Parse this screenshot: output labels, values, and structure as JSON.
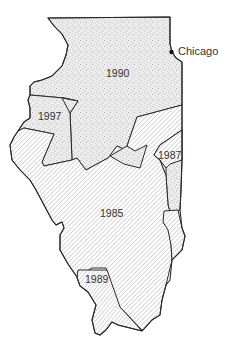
{
  "map": {
    "subject": "Illinois",
    "regions": [
      {
        "label": "1990",
        "fill": "stipple"
      },
      {
        "label": "1997",
        "fill": "stipple"
      },
      {
        "label": "1987",
        "fill": "hatch"
      },
      {
        "label": "1985",
        "fill": "hatch"
      },
      {
        "label": "1989",
        "fill": "hatch"
      }
    ],
    "city": {
      "name": "Chicago"
    },
    "colors": {
      "outline": "#2a2a2a",
      "stipple_bg": "#ececec",
      "stipple_dot": "#7a7a7a",
      "hatch_line": "#9a9a9a",
      "background": "#ffffff"
    }
  }
}
